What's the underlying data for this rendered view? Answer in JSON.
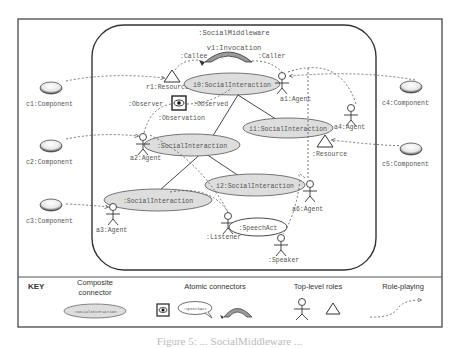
{
  "diagram": {
    "middleware_label": ":SocialMiddleware",
    "invocation_label": "v1:Invocation",
    "callee_label": ":Callee",
    "caller_label": ":Caller",
    "resource1_label": "r1:Resource",
    "observer_label": ":Observer",
    "observed_label": ":Observed",
    "observation_label": ":Observation",
    "resource2_label": ":Resource",
    "listener_label": ":Listener",
    "speaker_label": ":Speaker",
    "speechact_label": ":SpeechAct",
    "interactions": [
      {
        "label": "i0:SocialInteraction"
      },
      {
        "label": ":SocialInteraction"
      },
      {
        "label": "i1:SocialInteraction"
      },
      {
        "label": ":SocialInteraction"
      },
      {
        "label": "i2:SocialInteraction"
      }
    ],
    "agents": [
      {
        "label": "a1:Agent"
      },
      {
        "label": "a2:Agent"
      },
      {
        "label": "a3:Agent"
      },
      {
        "label": "a4:Agent"
      },
      {
        "label": "a5:Agent"
      },
      {
        "label": "a6:Agent"
      }
    ],
    "components": [
      {
        "label": "c1:Component"
      },
      {
        "label": "c2:Component"
      },
      {
        "label": "c3:Component"
      },
      {
        "label": "c4:Component"
      },
      {
        "label": "c5:Component"
      }
    ]
  },
  "key": {
    "title": "KEY",
    "composite_header_1": "Composite",
    "composite_header_2": "connector",
    "composite_example": ":SocialInteraction",
    "atomic_header": "Atomic connectors",
    "speechact_example": ":SpeechAct",
    "roles_header": "Top-level roles",
    "roleplaying_header": "Role-playing"
  },
  "caption": "Figure 5: ... SocialMiddleware ..."
}
